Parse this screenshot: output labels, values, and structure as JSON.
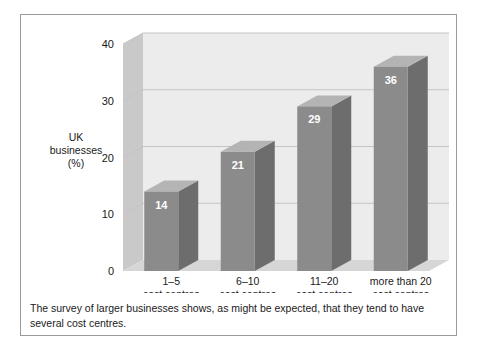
{
  "chart_data": {
    "type": "bar",
    "title": "",
    "subtitle": "",
    "xlabel": "",
    "ylabel": "UK businesses (%)",
    "ylabel_lines": [
      "UK",
      "businesses",
      "(%)"
    ],
    "categories": [
      "1–5 cost centres",
      "6–10 cost centres",
      "11–20 cost centres",
      "more than 20 cost centres"
    ],
    "category_lines": [
      [
        "1–5",
        "cost centres"
      ],
      [
        "6–10",
        "cost centres"
      ],
      [
        "11–20",
        "cost centres"
      ],
      [
        "more than 20",
        "cost centres"
      ]
    ],
    "values": [
      14,
      21,
      29,
      36
    ],
    "value_labels": [
      "14",
      "21",
      "29",
      "36"
    ],
    "ylim": [
      0,
      40
    ],
    "yticks": [
      0,
      10,
      20,
      30,
      40
    ],
    "ytick_labels": [
      "0",
      "10",
      "20",
      "30",
      "40"
    ],
    "grid": true,
    "grid_axis": "y",
    "legend": "none",
    "style": "3d-column",
    "colors": {
      "bar_front": "#8b8b8b",
      "bar_top": "#b4b4b4",
      "bar_side": "#6d6d6d",
      "plot_back_wall": "#ececec",
      "plot_left_wall": "#c9c9c9",
      "plot_floor": "#d6d6d6",
      "gridline": "#c4c4c4",
      "axis_text": "#1a1a1a",
      "value_label": "#ffffff",
      "frame_border": "#9a9a9a",
      "page_background": "#ffffff"
    }
  },
  "caption": {
    "text": "The survey of larger businesses shows, as might be expected, that they tend to have several cost centres."
  }
}
